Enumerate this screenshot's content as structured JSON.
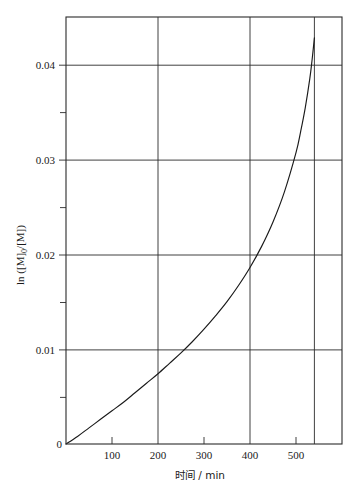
{
  "chart_data": {
    "type": "line",
    "title": "",
    "xlabel": "时间 / min",
    "ylabel": "ln ([M]0/[M])",
    "ylabel_parts": {
      "prefix": "ln ([M]",
      "subscript": "0",
      "suffix": "/[M])"
    },
    "xlim": [
      0,
      600
    ],
    "ylim": [
      0,
      0.045
    ],
    "grid": true,
    "grid_x_values": [
      200,
      400,
      540
    ],
    "grid_y_values": [
      0.01,
      0.02,
      0.03,
      0.04
    ],
    "xticks": [
      0,
      100,
      200,
      300,
      400,
      500
    ],
    "xtick_labels": [
      "",
      "100",
      "200",
      "300",
      "400",
      "500"
    ],
    "yticks": [
      0,
      0.005,
      0.01,
      0.015,
      0.02,
      0.025,
      0.03,
      0.035,
      0.04
    ],
    "ytick_labels": [
      "0",
      "",
      "0.01",
      "",
      "0.02",
      "",
      "0.03",
      "",
      "0.04"
    ],
    "origin_label": "0",
    "legend": null,
    "legend_position": "none",
    "series": [
      {
        "name": "ln([M]0/[M]) vs time",
        "x": [
          0,
          25,
          50,
          75,
          100,
          125,
          150,
          175,
          200,
          225,
          250,
          275,
          300,
          325,
          350,
          375,
          400,
          425,
          450,
          475,
          500,
          510,
          520,
          530,
          535,
          540
        ],
        "y": [
          0.0,
          0.0008,
          0.0017,
          0.0026,
          0.0035,
          0.0044,
          0.0054,
          0.0064,
          0.0074,
          0.0085,
          0.0096,
          0.0108,
          0.0121,
          0.0135,
          0.015,
          0.0167,
          0.0186,
          0.0208,
          0.0234,
          0.0266,
          0.0307,
          0.0329,
          0.0354,
          0.0385,
          0.0405,
          0.0428
        ]
      }
    ],
    "annotations": [],
    "colors": {
      "curve": "#1a1a1a",
      "grid": "#2b2b2b",
      "frame": "#2b2b2b",
      "background": "#ffffff",
      "text": "#1a1a1a"
    },
    "axis_pixel_map": {
      "plot_left": 66,
      "plot_right": 342,
      "plot_top": 17,
      "plot_bottom": 444
    }
  }
}
